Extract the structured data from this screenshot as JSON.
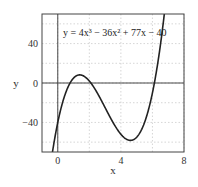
{
  "chart_data": {
    "type": "line",
    "title": "",
    "annotation": "y = 4x³ − 36x² + 77x − 40",
    "xlabel": "x",
    "ylabel": "y",
    "xlim": [
      -1,
      8
    ],
    "ylim": [
      -70,
      70
    ],
    "xticks": [
      0,
      4,
      8
    ],
    "yticks": [
      40,
      0,
      -40
    ],
    "grid": true,
    "legend": null,
    "series": [
      {
        "name": "y = 4x^3 - 36x^2 + 77x - 40",
        "function": "4x^3 - 36x^2 + 77x - 40",
        "x": [
          -0.3,
          0,
          0.5,
          1,
          1.3,
          1.5,
          2,
          2.5,
          3,
          3.5,
          4,
          4.5,
          4.7,
          5,
          5.5,
          6,
          6.2,
          6.5,
          6.8
        ],
        "values": [
          -66.5,
          -40,
          -10,
          5,
          7.7,
          7.5,
          2,
          -7.5,
          -19,
          -29.5,
          -36,
          -36.5,
          -35.8,
          -35,
          -28.5,
          -10,
          -1.5,
          12.5,
          30
        ]
      }
    ]
  }
}
